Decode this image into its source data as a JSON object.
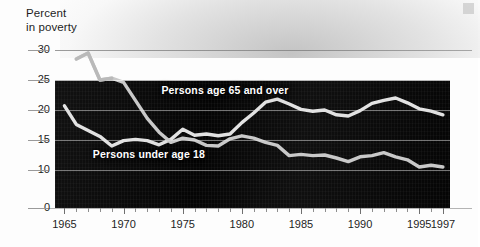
{
  "axis_title": {
    "line1": "Percent",
    "line2": "in poverty"
  },
  "chart_data": {
    "type": "line",
    "title": "",
    "subtitle": "",
    "xlabel": "",
    "ylabel": "Percent in poverty",
    "ylim": [
      0,
      30
    ],
    "xlim": [
      1964,
      1997
    ],
    "grid": true,
    "legend_position": "inline-labels",
    "y_ticks": [
      30,
      25,
      20,
      15,
      10,
      0
    ],
    "y_axis_break_between": [
      0,
      10
    ],
    "x_ticks": [
      1965,
      1966,
      1967,
      1968,
      1969,
      1970,
      1971,
      1972,
      1973,
      1974,
      1975,
      1976,
      1977,
      1978,
      1979,
      1980,
      1981,
      1982,
      1983,
      1984,
      1985,
      1986,
      1987,
      1988,
      1989,
      1990,
      1991,
      1992,
      1993,
      1994,
      1995,
      1996,
      1997
    ],
    "x_tick_labels": [
      "1965",
      "1970",
      "1975",
      "1980",
      "1985",
      "1990",
      "1995",
      "1997"
    ],
    "x_tick_label_years": [
      1965,
      1970,
      1975,
      1980,
      1985,
      1990,
      1995,
      1997
    ],
    "series": [
      {
        "name": "Persons age 65 and over",
        "color": "#c9c9c9",
        "label_x_year": 1973.2,
        "label_y_value": 23.4,
        "x": [
          1966,
          1967,
          1968,
          1969,
          1970,
          1971,
          1972,
          1973,
          1974,
          1975,
          1976,
          1977,
          1978,
          1979,
          1980,
          1981,
          1982,
          1983,
          1984,
          1985,
          1986,
          1987,
          1988,
          1989,
          1990,
          1991,
          1992,
          1993,
          1994,
          1995,
          1996,
          1997
        ],
        "values": [
          28.5,
          29.5,
          25.0,
          25.3,
          24.6,
          21.6,
          18.6,
          16.3,
          14.6,
          15.3,
          15.0,
          14.1,
          14.0,
          15.2,
          15.7,
          15.3,
          14.6,
          14.1,
          12.4,
          12.6,
          12.4,
          12.5,
          12.0,
          11.4,
          12.2,
          12.4,
          12.9,
          12.2,
          11.7,
          10.5,
          10.8,
          10.5
        ]
      },
      {
        "name": "Persons under age 18",
        "color": "#e2e2e2",
        "label_x_year": 1967.4,
        "label_y_value": 12.6,
        "x": [
          1965,
          1966,
          1967,
          1968,
          1969,
          1970,
          1971,
          1972,
          1973,
          1974,
          1975,
          1976,
          1977,
          1978,
          1979,
          1980,
          1981,
          1982,
          1983,
          1984,
          1985,
          1986,
          1987,
          1988,
          1989,
          1990,
          1991,
          1992,
          1993,
          1994,
          1995,
          1996,
          1997
        ],
        "values": [
          20.7,
          17.6,
          16.6,
          15.6,
          14.0,
          14.9,
          15.1,
          14.9,
          14.2,
          15.1,
          16.8,
          15.8,
          16.0,
          15.7,
          16.0,
          17.9,
          19.5,
          21.3,
          21.8,
          21.0,
          20.1,
          19.8,
          20.0,
          19.2,
          19.0,
          19.9,
          21.1,
          21.6,
          22.0,
          21.2,
          20.2,
          19.8,
          19.2
        ]
      }
    ],
    "notes": [
      "Upper curve after 1982 is Persons under age 18; upper curve before 1974 is Persons age 65 and over.",
      "Series cross near 1974."
    ]
  },
  "colors": {
    "plot_background": "#050505",
    "page_background": "#ffffff",
    "gridline": "#ebebeb",
    "text": "#1d1d1d",
    "series_over65": "#c9c9c9",
    "series_under18": "#e2e2e2"
  }
}
